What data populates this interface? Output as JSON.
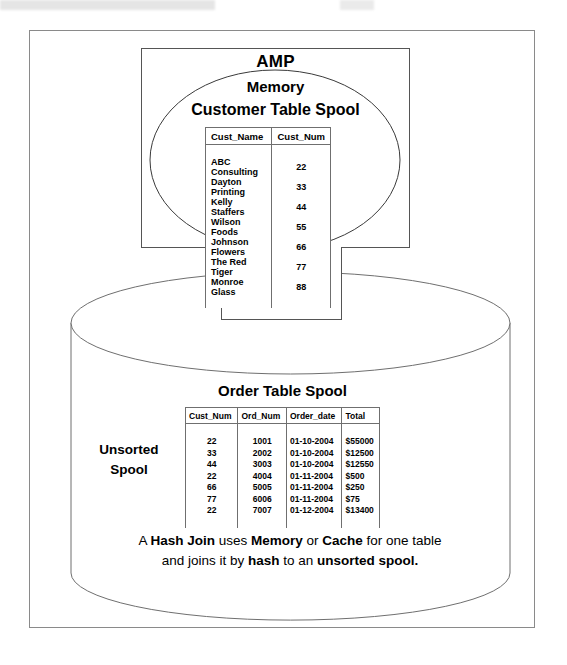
{
  "diagram": {
    "amp_label": "AMP",
    "memory_label": "Memory",
    "customer_spool_title": "Customer Table Spool",
    "order_spool_title": "Order Table Spool",
    "unsorted_spool_label_line1": "Unsorted",
    "unsorted_spool_label_line2": "Spool"
  },
  "customer_table": {
    "columns": [
      "Cust_Name",
      "Cust_Num"
    ],
    "rows": [
      {
        "cust_name": "ABC Consulting",
        "cust_num": "22"
      },
      {
        "cust_name": "Dayton Printing",
        "cust_num": "33"
      },
      {
        "cust_name": "Kelly Staffers",
        "cust_num": "44"
      },
      {
        "cust_name": "Wilson Foods",
        "cust_num": "55"
      },
      {
        "cust_name": "Johnson Flowers",
        "cust_num": "66"
      },
      {
        "cust_name": "The Red Tiger",
        "cust_num": "77"
      },
      {
        "cust_name": "Monroe Glass",
        "cust_num": "88"
      }
    ]
  },
  "order_table": {
    "columns": [
      "Cust_Num",
      "Ord_Num",
      "Order_date",
      "Total"
    ],
    "rows": [
      {
        "cust_num": "22",
        "ord_num": "1001",
        "order_date": "01-10-2004",
        "total": "$55000"
      },
      {
        "cust_num": "33",
        "ord_num": "2002",
        "order_date": "01-10-2004",
        "total": "$12500"
      },
      {
        "cust_num": "44",
        "ord_num": "3003",
        "order_date": "01-10-2004",
        "total": "$12550"
      },
      {
        "cust_num": "22",
        "ord_num": "4004",
        "order_date": "01-11-2004",
        "total": "$500"
      },
      {
        "cust_num": "66",
        "ord_num": "5005",
        "order_date": "01-11-2004",
        "total": "$250"
      },
      {
        "cust_num": "77",
        "ord_num": "6006",
        "order_date": "01-11-2004",
        "total": "$75"
      },
      {
        "cust_num": "22",
        "ord_num": "7007",
        "order_date": "01-12-2004",
        "total": "$13400"
      }
    ]
  },
  "caption": {
    "line1_part1": "A ",
    "line1_bold1": "Hash Join",
    "line1_part2": " uses ",
    "line1_bold2": "Memory",
    "line1_part3": " or ",
    "line1_bold3": "Cache",
    "line1_part4": " for one table",
    "line2_part1": "and joins it by ",
    "line2_bold1": "hash",
    "line2_part2": " to an ",
    "line2_bold2": "unsorted spool."
  },
  "colors": {
    "ink": "#000000",
    "line": "#555555",
    "frame": "#8a8a8a",
    "background": "#ffffff"
  }
}
